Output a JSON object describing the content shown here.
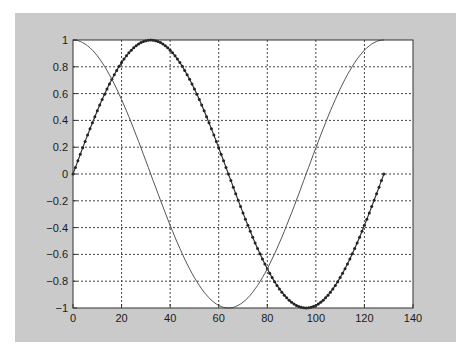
{
  "figure": {
    "background": "#cacaca",
    "axes_background": "#ffffff"
  },
  "chart_data": {
    "type": "line",
    "title": "",
    "xlabel": "",
    "ylabel": "",
    "xlim": [
      0,
      140
    ],
    "ylim": [
      -1,
      1
    ],
    "grid": true,
    "grid_style": "dashed",
    "legend": null,
    "x_ticks": [
      0,
      20,
      40,
      60,
      80,
      100,
      120,
      140
    ],
    "x_tick_labels": [
      "0",
      "20",
      "40",
      "60",
      "80",
      "100",
      "120",
      "140"
    ],
    "y_ticks": [
      1,
      0.8,
      0.6,
      0.4,
      0.2,
      0,
      -0.2,
      -0.4,
      -0.6,
      -0.8,
      -1
    ],
    "y_tick_labels": [
      "1",
      "0.8",
      "0.6",
      "0.4",
      "0.2",
      "0",
      "−0.2",
      "−0.4",
      "−0.6",
      "−0.8",
      "−1"
    ],
    "x": "n = 0..128",
    "series": [
      {
        "name": "sin(2*pi*n/128)",
        "style": "line-with-dot-markers",
        "color": "#333333",
        "n_points": 129,
        "period": 128,
        "function": "sin",
        "x_range": [
          0,
          128
        ],
        "key_points": [
          [
            0,
            0
          ],
          [
            32,
            1
          ],
          [
            64,
            0
          ],
          [
            96,
            -1
          ],
          [
            128,
            0
          ]
        ]
      },
      {
        "name": "cos(2*pi*n/128)",
        "style": "thin-line",
        "color": "#555555",
        "n_points": 129,
        "period": 128,
        "function": "cos",
        "x_range": [
          0,
          128
        ],
        "key_points": [
          [
            0,
            1
          ],
          [
            32,
            0
          ],
          [
            64,
            -1
          ],
          [
            96,
            0
          ],
          [
            128,
            1
          ]
        ]
      }
    ]
  }
}
